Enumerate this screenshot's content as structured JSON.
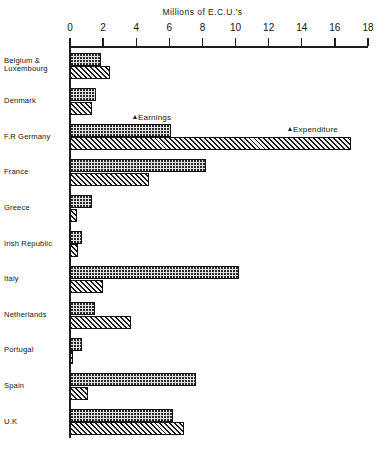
{
  "chart_data": {
    "type": "bar",
    "orientation": "horizontal",
    "title": "Millions of E.C.U.'s",
    "xlabel": "Millions of E.C.U.'s",
    "ylabel": "",
    "xlim": [
      0,
      18
    ],
    "xticks": [
      0,
      2,
      4,
      6,
      8,
      10,
      12,
      14,
      16,
      18
    ],
    "grid": false,
    "legend_position": "inline-annotation",
    "categories": [
      "Belgium &\nLuxembourg",
      "Denmark",
      "F.R. Germany",
      "France",
      "Greece",
      "Irish Republic",
      "Italy",
      "Netherlands",
      "Portugal",
      "Spain",
      "U.K."
    ],
    "series": [
      {
        "name": "Earnings",
        "fill": "dotted",
        "values": [
          1.9,
          1.6,
          6.1,
          8.2,
          1.3,
          0.7,
          10.2,
          1.5,
          0.7,
          7.6,
          6.2
        ]
      },
      {
        "name": "Expenditure",
        "fill": "diagonal-hatch",
        "values": [
          2.4,
          1.3,
          17.0,
          4.8,
          0.4,
          0.5,
          2.0,
          3.7,
          0.1,
          1.1,
          6.9
        ]
      }
    ],
    "annotations": [
      {
        "text": "Earnings",
        "points_to": "F.R. Germany earnings bar"
      },
      {
        "text": "Expenditure",
        "points_to": "F.R. Germany expenditure bar"
      }
    ]
  },
  "axis": {
    "tick_labels": [
      "0",
      "2",
      "4",
      "6",
      "8",
      "10",
      "12",
      "14",
      "16",
      "18"
    ]
  },
  "labels": {
    "belgium_line1": "Belgium &",
    "belgium_line2": "Luxembourg",
    "denmark": "Denmark",
    "germany": "F.R  Germany",
    "france": "France",
    "greece": "Greece",
    "ireland": "Irish Republic",
    "italy": "Italy",
    "netherlands": "Netherlands",
    "portugal": "Portugal",
    "spain": "Spain",
    "uk": "U.K",
    "title": "Millions of E.C.U.'s",
    "annot_earnings": "Earnings",
    "annot_expenditure": "Expenditure"
  },
  "colors": {
    "ink": "#1b1b1b",
    "background": "#ffffff",
    "earnings_fill": "#e2e2e2",
    "expenditure_fill": "#ededed"
  }
}
